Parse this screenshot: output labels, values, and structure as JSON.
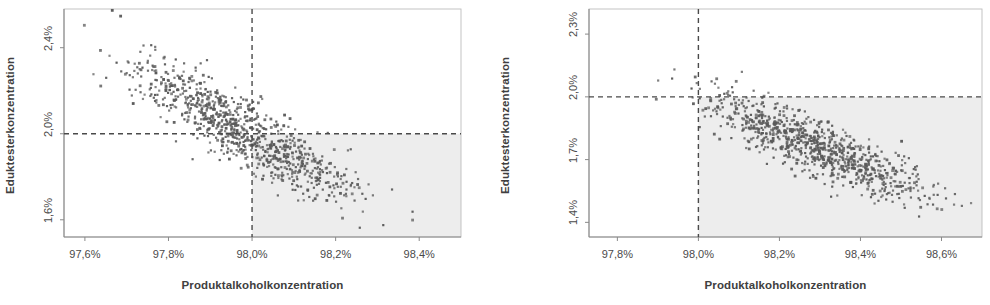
{
  "chart_data": [
    {
      "id": "left",
      "type": "scatter",
      "title": "",
      "xlabel": "Produktalkoholkonzentration",
      "ylabel": "Eduktesterkonzentration",
      "xlim": [
        97.55,
        98.5
      ],
      "ylim": [
        1.52,
        2.58
      ],
      "xticks": [
        97.6,
        97.8,
        98.0,
        98.2,
        98.4
      ],
      "xticklabels": [
        "97,6%",
        "97,8%",
        "98,0%",
        "98,2%",
        "98,4%"
      ],
      "yticks": [
        1.6,
        2.0,
        2.4
      ],
      "yticklabels": [
        "1,6%",
        "2,0%",
        "2,4%"
      ],
      "grid": false,
      "legend": "none",
      "reference_lines": {
        "vertical_x": 98.0,
        "horizontal_y": 2.0,
        "style": "dashed",
        "color": "#4a4a4a"
      },
      "shaded_quadrant": {
        "x_from": 98.0,
        "y_to": 2.0,
        "color": "#ededed",
        "description": "lower-right quadrant highlighted"
      },
      "marker": {
        "shape": "square",
        "size_px": 2.2,
        "color": "#5a5a5a"
      },
      "n_points": 900,
      "correlation": -0.88,
      "center": {
        "x": 97.98,
        "y": 2.01
      },
      "spread": {
        "x": 0.135,
        "y": 0.165
      },
      "points_note": "Dense negatively correlated cloud from upper-left to lower-right"
    },
    {
      "id": "right",
      "type": "scatter",
      "title": "",
      "xlabel": "Produktalkoholkonzentration",
      "ylabel": "Eduktesterkonzentration",
      "xlim": [
        97.73,
        98.7
      ],
      "ylim": [
        1.33,
        2.42
      ],
      "xticks": [
        97.8,
        98.0,
        98.2,
        98.4,
        98.6
      ],
      "xticklabels": [
        "97,8%",
        "98,0%",
        "98,2%",
        "98,4%",
        "98,6%"
      ],
      "yticks": [
        1.4,
        1.7,
        2.0,
        2.3
      ],
      "yticklabels": [
        "1,4%",
        "1,7%",
        "2,0%",
        "2,3%"
      ],
      "grid": false,
      "legend": "none",
      "reference_lines": {
        "vertical_x": 98.0,
        "horizontal_y": 2.0,
        "style": "dashed",
        "color": "#4a4a4a"
      },
      "shaded_quadrant": {
        "x_from": 98.0,
        "y_to": 2.0,
        "color": "#ededed",
        "description": "lower-right quadrant highlighted"
      },
      "marker": {
        "shape": "square",
        "size_px": 2.2,
        "color": "#5a5a5a"
      },
      "n_points": 900,
      "correlation": -0.86,
      "center": {
        "x": 98.295,
        "y": 1.755
      },
      "spread": {
        "x": 0.135,
        "y": 0.125
      },
      "points_note": "Dense negatively correlated cloud, shifted right and down versus left chart"
    }
  ],
  "colors": {
    "background": "#ffffff",
    "axis": "#8a8a8a",
    "text": "#404040",
    "marker": "#5a5a5a",
    "shade": "#ededed",
    "dash": "#4a4a4a"
  }
}
